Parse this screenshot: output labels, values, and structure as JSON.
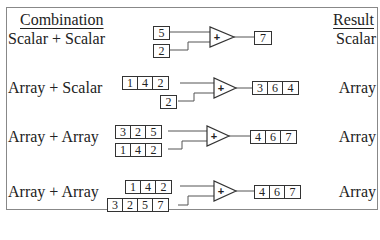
{
  "header": {
    "left": "Combination",
    "right": "Result"
  },
  "rows": [
    {
      "label": "Scalar + Scalar",
      "a": [
        "5"
      ],
      "b": [
        "2"
      ],
      "out": [
        "7"
      ],
      "result": "Scalar"
    },
    {
      "label": "Array + Scalar",
      "a": [
        "1",
        "4",
        "2"
      ],
      "b": [
        "2"
      ],
      "out": [
        "3",
        "6",
        "4"
      ],
      "result": "Array"
    },
    {
      "label": "Array + Array",
      "a": [
        "3",
        "2",
        "5"
      ],
      "b": [
        "1",
        "4",
        "2"
      ],
      "out": [
        "4",
        "6",
        "7"
      ],
      "result": "Array"
    },
    {
      "label": "Array + Array",
      "a": [
        "1",
        "4",
        "2"
      ],
      "b": [
        "3",
        "2",
        "5",
        "7"
      ],
      "out": [
        "4",
        "6",
        "7"
      ],
      "result": "Array"
    }
  ],
  "operator_symbol": "+"
}
